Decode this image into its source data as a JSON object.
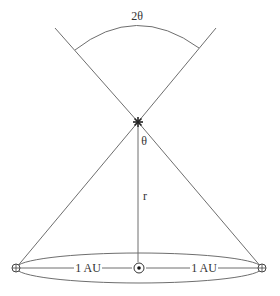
{
  "diagram": {
    "labels": {
      "angle_full": "2θ",
      "angle_half": "θ",
      "distance": "r",
      "left_au": "1 AU",
      "right_au": "1 AU"
    },
    "symbols": {
      "star": "star-icon",
      "sun": "sun-icon",
      "earth_left": "earth-icon",
      "earth_right": "earth-icon"
    },
    "colors": {
      "line": "#6e6e6e",
      "text": "#333333",
      "background": "#ffffff"
    }
  }
}
